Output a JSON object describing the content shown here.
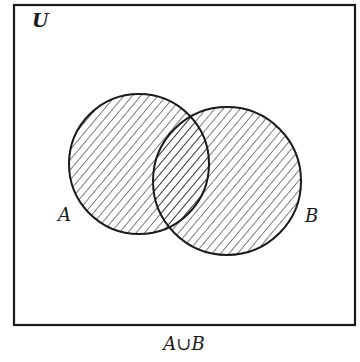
{
  "diagram": {
    "type": "venn",
    "universe_label": "U",
    "sets": [
      {
        "label": "A",
        "shaded": true
      },
      {
        "label": "B",
        "shaded": true
      }
    ],
    "caption": "A∪B",
    "shading": "diagonal-hatch",
    "colors": {
      "stroke": "#1a1a1a",
      "background": "#ffffff"
    }
  }
}
